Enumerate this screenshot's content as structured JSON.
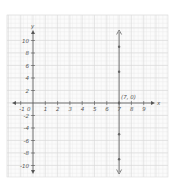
{
  "chart_data": {
    "type": "line",
    "title": "",
    "xlabel": "x",
    "ylabel": "y",
    "xlim": [
      -1,
      9
    ],
    "ylim": [
      -10,
      10
    ],
    "grid": true,
    "x_ticks": [
      "-1",
      "0",
      "1",
      "2",
      "3",
      "4",
      "5",
      "6",
      "7",
      "8",
      "9"
    ],
    "y_ticks": [
      "10",
      "8",
      "6",
      "4",
      "2",
      "-2",
      "-4",
      "-6",
      "-8",
      "-10"
    ],
    "series": [
      {
        "name": "x = 7",
        "kind": "vertical-line",
        "x": 7,
        "points": [
          {
            "x": 7,
            "y": 9
          },
          {
            "x": 7,
            "y": 5
          },
          {
            "x": 7,
            "y": 0
          },
          {
            "x": 7,
            "y": -5
          },
          {
            "x": 7,
            "y": -9
          }
        ]
      }
    ],
    "annotations": [
      {
        "text": "(7, 0)",
        "x": 7,
        "y": 0
      }
    ],
    "colors": {
      "grid": "#d9d9d9",
      "axis": "#555555",
      "line": "#666666",
      "background": "#ffffff"
    }
  }
}
